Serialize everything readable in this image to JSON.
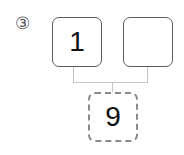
{
  "problem": {
    "label": "③",
    "top_boxes": [
      {
        "value": "1"
      },
      {
        "value": ""
      }
    ],
    "bottom_box": {
      "value": "9"
    }
  },
  "colors": {
    "box_border": "#5a5a5a",
    "dashed_border": "#8a8a8a",
    "connector": "#c4c4c4",
    "text": "#111111"
  }
}
